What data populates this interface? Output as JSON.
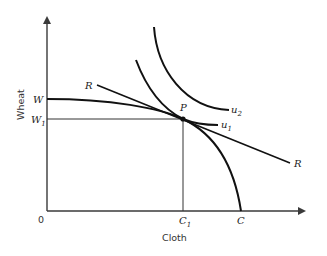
{
  "diagram": {
    "type": "economics-ppf-indifference",
    "axes": {
      "x_label": "Cloth",
      "y_label": "Wheat",
      "origin_label": "0"
    },
    "y_ticks": {
      "w": "W",
      "w1_main": "W",
      "w1_sub": "1"
    },
    "x_ticks": {
      "c1_main": "C",
      "c1_sub": "1",
      "c": "C"
    },
    "lines": {
      "price_line_label_left": "R",
      "price_line_label_right": "R"
    },
    "curves": {
      "u1_main": "u",
      "u1_sub": "1",
      "u2_main": "u",
      "u2_sub": "2"
    },
    "point": {
      "label": "P"
    },
    "colors": {
      "curve": "#111111",
      "axis": "#3a3a3a",
      "background": "#ffffff"
    }
  }
}
